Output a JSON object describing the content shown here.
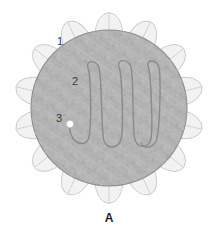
{
  "figure": {
    "panel_label": "A",
    "background_color": "#ffffff",
    "callouts": [
      {
        "id": "1",
        "text": "1",
        "x": 57,
        "y": 36,
        "target": "tooth-notch"
      },
      {
        "id": "2",
        "text": "2",
        "x": 72,
        "y": 76,
        "target": "serpentine-line"
      },
      {
        "id": "3",
        "text": "3",
        "x": 56,
        "y": 113,
        "target": "white-dot"
      }
    ],
    "disc": {
      "name": "textured-inner-disc",
      "fill_color": "#b4b4b4",
      "stroke_color": "#8d8d8d",
      "center_x": 109,
      "center_y": 108,
      "radius": 78
    },
    "teeth": {
      "name": "gear-teeth-ring",
      "count": 14,
      "fill_color": "#f2f2f2",
      "stroke_color": "#c9c9c9",
      "outer_radius": 97,
      "inner_radius": 76
    },
    "serpentine": {
      "name": "serpentine-trace",
      "stroke_color": "#8a8a8a",
      "stroke_width": 1.4,
      "loop_count": 5,
      "top_y": 62,
      "bottom_y": 146,
      "start_x": 74,
      "end_x": 146
    },
    "marker_dot": {
      "name": "white-start-dot",
      "fill_color": "#ffffff",
      "stroke_color": "#c0c0c0",
      "x": 70,
      "y": 124,
      "radius": 3.6
    }
  }
}
